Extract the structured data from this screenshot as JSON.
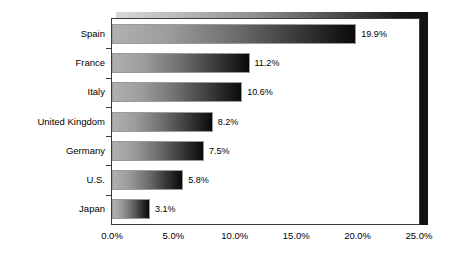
{
  "chart_data": {
    "type": "bar",
    "orientation": "horizontal",
    "title": "",
    "xlabel": "",
    "ylabel": "",
    "categories": [
      "Spain",
      "France",
      "Italy",
      "United Kingdom",
      "Germany",
      "U.S.",
      "Japan"
    ],
    "values": [
      19.9,
      11.2,
      10.6,
      8.2,
      7.5,
      5.8,
      3.1
    ],
    "data_labels": [
      "19.9%",
      "11.2%",
      "10.6%",
      "8.2%",
      "7.5%",
      "5.8%",
      "3.1%"
    ],
    "xlim": [
      0,
      25
    ],
    "xticks": [
      0,
      5,
      10,
      15,
      20,
      25
    ],
    "xtick_labels": [
      "0.0%",
      "5.0%",
      "10.0%",
      "15.0%",
      "20.0%",
      "25.0%"
    ],
    "grid": false,
    "legend": false,
    "series": [
      {
        "name": "",
        "values": [
          19.9,
          11.2,
          10.6,
          8.2,
          7.5,
          5.8,
          3.1
        ]
      }
    ],
    "bar_fill": "horizontal-gradient-light-gray-to-black",
    "colors": {
      "background": "#ffffff",
      "bar_gradient_start": "#b0b0b0",
      "bar_gradient_end": "#0a0a0a",
      "bar_border": "#9a9a9a",
      "axis": "#3a3a3a",
      "text": "#000000",
      "shadow_wall": "#131313"
    }
  }
}
